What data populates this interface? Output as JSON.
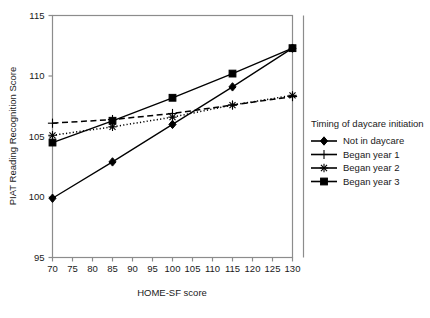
{
  "chart_data": {
    "type": "line",
    "title": "",
    "xlabel": "HOME-SF score",
    "ylabel": "PIAT Reading Recognition Score",
    "xlim": [
      70,
      130
    ],
    "ylim": [
      95,
      115
    ],
    "xticks": [
      70,
      75,
      80,
      85,
      90,
      95,
      100,
      105,
      110,
      115,
      120,
      125,
      130
    ],
    "yticks": [
      95,
      100,
      105,
      110,
      115
    ],
    "grid": false,
    "legend_position": "right",
    "legend_title": "Timing of daycare initiation",
    "x": [
      70,
      85,
      100,
      115,
      130
    ],
    "series": [
      {
        "name": "Not in daycare",
        "marker": "diamond",
        "linestyle": "solid",
        "values": [
          99.9,
          102.9,
          106.0,
          109.1,
          112.3
        ]
      },
      {
        "name": "Began year 1",
        "marker": "plus",
        "linestyle": "dashed",
        "values": [
          106.1,
          106.4,
          106.9,
          107.6,
          108.3
        ]
      },
      {
        "name": "Began year 2",
        "marker": "asterisk",
        "linestyle": "dotted",
        "values": [
          105.1,
          105.8,
          106.6,
          107.6,
          108.4
        ]
      },
      {
        "name": "Began year 3",
        "marker": "square",
        "linestyle": "solid",
        "values": [
          104.5,
          106.3,
          108.2,
          110.2,
          112.3
        ]
      }
    ]
  },
  "colors": {
    "ink": "#000000",
    "frame": "#8c8c8c",
    "background": "#ffffff"
  }
}
